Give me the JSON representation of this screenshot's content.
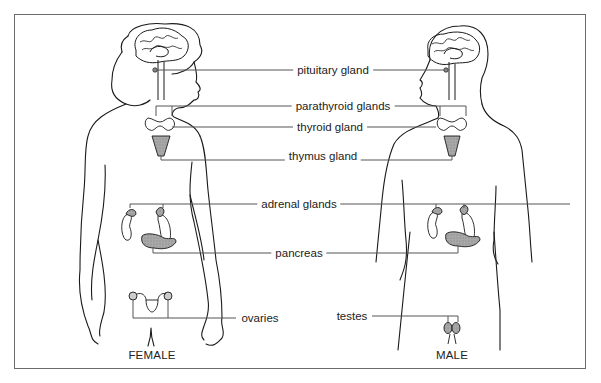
{
  "diagram": {
    "figures": [
      {
        "id": "female",
        "label": "FEMALE"
      },
      {
        "id": "male",
        "label": "MALE"
      }
    ],
    "labels": {
      "pituitary": "pituitary gland",
      "parathyroid": "parathyroid glands",
      "thyroid": "thyroid gland",
      "thymus": "thymus gland",
      "adrenal": "adrenal glands",
      "pancreas": "pancreas",
      "ovaries": "ovaries",
      "testes": "testes"
    },
    "colors": {
      "outline": "#1a1a1a",
      "leader_line": "#555555",
      "gland_fill": "#9a9a9a",
      "frame": "#6b6b6b"
    }
  }
}
